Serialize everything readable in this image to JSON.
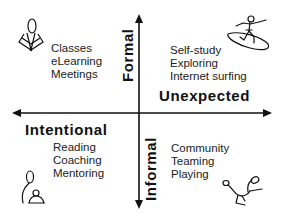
{
  "diagram": {
    "axes": {
      "vertical": {
        "top_label": "Formal",
        "bottom_label": "Informal"
      },
      "horizontal": {
        "left_label": "Intentional",
        "right_label": "Unexpected"
      }
    },
    "quadrants": {
      "top_left": {
        "icon": "classroom-lamp-icon",
        "items": [
          "Classes",
          "eLearning",
          "Meetings"
        ]
      },
      "top_right": {
        "icon": "surfer-icon",
        "items": [
          "Self-study",
          "Exploring",
          "Internet surfing"
        ]
      },
      "bottom_left": {
        "icon": "mentor-mentee-icon",
        "items": [
          "Reading",
          "Coaching",
          "Mentoring"
        ]
      },
      "bottom_right": {
        "icon": "playing-figure-icon",
        "items": [
          "Community",
          "Teaming",
          "Playing"
        ]
      }
    },
    "colors": {
      "ink": "#111111",
      "background": "#ffffff"
    }
  }
}
